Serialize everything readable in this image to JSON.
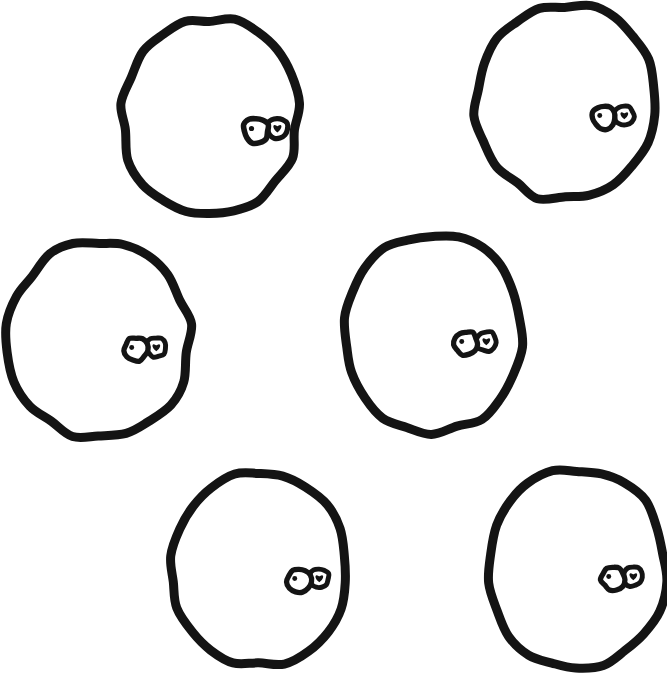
{
  "figure": {
    "background_color": "#ffffff",
    "ink_color": "#141414",
    "width": 667,
    "height": 676,
    "style": "hand-drawn marker line art, no text, no labels",
    "shape_count": 6,
    "arrangement": "three staggered rows of two shapes each"
  },
  "shapes": [
    {
      "id": "shape-1",
      "name": "top-left-blob",
      "row": 1,
      "column": "left",
      "cx": 210,
      "cy": 117,
      "rx": 88,
      "ry": 99,
      "stroke_width": 9,
      "seed": 11,
      "mark": {
        "name": "eye-pair-mark",
        "x": 256,
        "y": 130,
        "scale": 1.0,
        "left_ring": {
          "label": "dot-ring",
          "r": 12.5,
          "dot_r": 2.6,
          "dot_dx": -4.5,
          "dot_dy": -1.5
        },
        "right_ring": {
          "label": "heart-ring",
          "dx": 21,
          "dy": -2,
          "r": 10.5
        }
      }
    },
    {
      "id": "shape-2",
      "name": "top-right-blob",
      "row": 1,
      "column": "right",
      "cx": 565,
      "cy": 102,
      "rx": 90,
      "ry": 98,
      "stroke_width": 9,
      "seed": 23,
      "mark": {
        "name": "eye-pair-mark",
        "x": 604,
        "y": 117,
        "scale": 0.95,
        "left_ring": {
          "label": "dot-ring",
          "r": 12.5,
          "dot_r": 2.6,
          "dot_dx": -4.5,
          "dot_dy": -1.5
        },
        "right_ring": {
          "label": "heart-ring",
          "dx": 21,
          "dy": -2,
          "r": 10.5
        }
      }
    },
    {
      "id": "shape-3",
      "name": "middle-left-blob",
      "row": 2,
      "column": "left",
      "cx": 99,
      "cy": 339,
      "rx": 91,
      "ry": 99,
      "stroke_width": 9,
      "seed": 37,
      "mark": {
        "name": "eye-pair-mark",
        "x": 136,
        "y": 349,
        "scale": 0.95,
        "left_ring": {
          "label": "dot-ring",
          "r": 12.5,
          "dot_r": 2.6,
          "dot_dx": -4.5,
          "dot_dy": -1.5
        },
        "right_ring": {
          "label": "heart-ring",
          "dx": 21,
          "dy": -2,
          "r": 10.5
        }
      }
    },
    {
      "id": "shape-4",
      "name": "middle-right-blob",
      "row": 2,
      "column": "right",
      "cx": 432,
      "cy": 333,
      "rx": 89,
      "ry": 100,
      "stroke_width": 9,
      "seed": 53,
      "mark": {
        "name": "eye-pair-mark",
        "x": 466,
        "y": 343,
        "scale": 0.95,
        "left_ring": {
          "label": "dot-ring",
          "r": 12.5,
          "dot_r": 2.6,
          "dot_dx": -4.5,
          "dot_dy": -1.5
        },
        "right_ring": {
          "label": "heart-ring",
          "dx": 21,
          "dy": -2,
          "r": 10.5
        }
      }
    },
    {
      "id": "shape-5",
      "name": "bottom-left-blob",
      "row": 3,
      "column": "left",
      "cx": 259,
      "cy": 568,
      "rx": 89,
      "ry": 98,
      "stroke_width": 9,
      "seed": 71,
      "mark": {
        "name": "eye-pair-mark",
        "x": 299,
        "y": 580,
        "scale": 0.95,
        "left_ring": {
          "label": "dot-ring",
          "r": 12.5,
          "dot_r": 2.6,
          "dot_dx": -4.5,
          "dot_dy": -1.5
        },
        "right_ring": {
          "label": "heart-ring",
          "dx": 21,
          "dy": -2,
          "r": 10.5
        }
      }
    },
    {
      "id": "shape-6",
      "name": "bottom-right-blob",
      "row": 3,
      "column": "right",
      "cx": 577,
      "cy": 568,
      "rx": 89,
      "ry": 100,
      "stroke_width": 9,
      "seed": 89,
      "mark": {
        "name": "eye-pair-mark",
        "x": 613,
        "y": 578,
        "scale": 0.95,
        "left_ring": {
          "label": "dot-ring",
          "r": 12.5,
          "dot_r": 2.6,
          "dot_dx": -4.5,
          "dot_dy": -1.5
        },
        "right_ring": {
          "label": "heart-ring",
          "dx": 21,
          "dy": -2,
          "r": 10.5
        }
      }
    }
  ]
}
